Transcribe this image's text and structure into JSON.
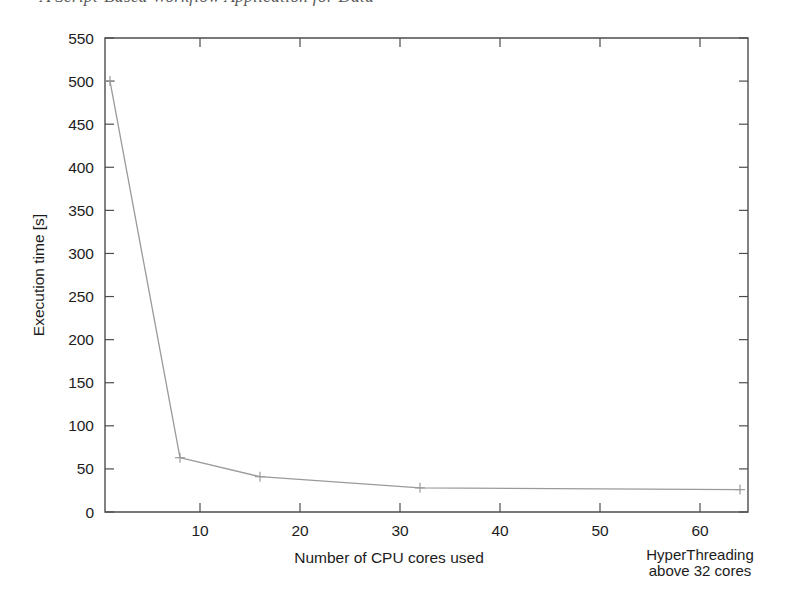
{
  "page_header": {
    "running_text": "A Script-Based Workflow Application for Data"
  },
  "figure": {
    "y_axis_title": "Execution time [s]",
    "x_axis_title": "Number of CPU cores used",
    "annotation_line1": "HyperThreading",
    "annotation_line2": "above 32 cores",
    "line_color": "#9a9a9a",
    "axis_color": "#4d4d4d",
    "background_color": "#ffffff"
  },
  "chart_data": {
    "type": "line",
    "title": "",
    "xlabel": "Number of CPU cores used",
    "ylabel": "Execution time [s]",
    "xlim": [
      0.5,
      64.8
    ],
    "ylim": [
      0,
      550
    ],
    "grid": false,
    "legend": null,
    "marker": "plus",
    "x_ticks": [
      10,
      20,
      30,
      40,
      50,
      60
    ],
    "y_ticks": [
      0,
      50,
      100,
      150,
      200,
      250,
      300,
      350,
      400,
      450,
      500,
      550
    ],
    "x": [
      1,
      8,
      16,
      32,
      64
    ],
    "y": [
      500,
      63,
      41,
      28,
      26
    ],
    "series": [
      {
        "name": "Execution time",
        "points": [
          {
            "x": 1,
            "y": 500
          },
          {
            "x": 8,
            "y": 63
          },
          {
            "x": 16,
            "y": 41
          },
          {
            "x": 32,
            "y": 28
          },
          {
            "x": 64,
            "y": 26
          }
        ]
      }
    ],
    "annotations": [
      {
        "text": "HyperThreading above 32 cores",
        "x": 60,
        "y": -60,
        "position": "below-axis-right"
      }
    ]
  }
}
